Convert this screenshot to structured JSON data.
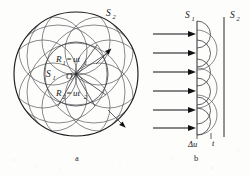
{
  "figure": {
    "background_color": "#fdfdfc",
    "ink_color": "#1b1b1e",
    "width": 249,
    "height": 176
  },
  "panel_a": {
    "caption": "a",
    "label_s1": "S",
    "label_s1_sub": "1",
    "label_s2": "S",
    "label_s2_sub": "2",
    "label_center": "O",
    "radius1": {
      "symbol": "R",
      "symbol_sub": "1",
      "equals": "=",
      "expr": "ut",
      "expr_sub": "1"
    },
    "radius2": {
      "symbol": "R",
      "symbol_sub": "2",
      "equals": "=",
      "expr": "ut",
      "expr_sub": "2"
    },
    "description": "Concentric spherical wavefronts S1 and S2 about source O with secondary Huygens wavelets drawn as overlapping circles",
    "inner_circle_count": 1,
    "outer_circle_count": 1,
    "wavelet_count": 8
  },
  "panel_b": {
    "caption": "b",
    "label_s1": "S",
    "label_s1_sub": "1",
    "label_s2": "S",
    "label_s2_sub": "2",
    "label_delta_u": "Δu",
    "label_t": "t",
    "description": "Plane wavefront S1 with incoming rays and secondary spherical wavelets forming new plane wavefront S2",
    "ray_count": 6,
    "wavelet_count": 6
  }
}
